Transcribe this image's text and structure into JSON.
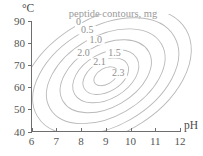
{
  "chart_data": {
    "type": "contour",
    "title": "peptide contours, mg",
    "xlabel": "pH",
    "ylabel": "°C",
    "xlim": [
      6,
      12
    ],
    "ylim": [
      40,
      90
    ],
    "xticks": [
      6,
      7,
      8,
      9,
      10,
      11,
      12
    ],
    "xtick_labels": [
      "6",
      "7",
      "8",
      "9",
      "10",
      "11",
      "12"
    ],
    "yticks": [
      40,
      50,
      60,
      70,
      80,
      90
    ],
    "ytick_labels": [
      "40",
      "50",
      "60",
      "70",
      "80",
      "90"
    ],
    "grid": false,
    "legend": "none",
    "units": "mg",
    "contour_levels": [
      0,
      0.5,
      1.0,
      1.5,
      2.0,
      2.1,
      2.3
    ],
    "contour_level_labels": [
      "0",
      "0.5",
      "1.0",
      "1.5",
      "2.0",
      "2.1",
      "2.3"
    ],
    "peak": {
      "pH": 9.0,
      "temperature_C": 65.0,
      "value_mg": 2.4
    },
    "contours": [
      {
        "level": 0,
        "label": "0",
        "label_position": {
          "pH": 7.9,
          "temperature_C": 88.6
        },
        "ellipse": {
          "cx_pH": 9.0,
          "cy_C": 65.0,
          "rx_pH": 3.75,
          "ry_C": 26.5,
          "rotation_deg": -30
        }
      },
      {
        "level": 0.5,
        "label": "0.5",
        "label_position": {
          "pH": 8.25,
          "temperature_C": 85.2
        },
        "ellipse": {
          "cx_pH": 9.0,
          "cy_C": 65.0,
          "rx_pH": 3.2,
          "ry_C": 22.5,
          "rotation_deg": -30
        }
      },
      {
        "level": 1.0,
        "label": "1.0",
        "label_position": {
          "pH": 8.6,
          "temperature_C": 80.6
        },
        "ellipse": {
          "cx_pH": 9.0,
          "cy_C": 65.0,
          "rx_pH": 2.6,
          "ry_C": 18.2,
          "rotation_deg": -30
        }
      },
      {
        "level": 1.5,
        "label": "1.5",
        "label_position": {
          "pH": 9.35,
          "temperature_C": 74.5
        },
        "ellipse": {
          "cx_pH": 9.0,
          "cy_C": 65.0,
          "rx_pH": 2.0,
          "ry_C": 14.0,
          "rotation_deg": -30
        }
      },
      {
        "level": 2.0,
        "label": "2.0",
        "label_position": {
          "pH": 8.1,
          "temperature_C": 74.4
        },
        "ellipse": {
          "cx_pH": 9.0,
          "cy_C": 65.0,
          "rx_pH": 1.45,
          "ry_C": 10.2,
          "rotation_deg": -30
        }
      },
      {
        "level": 2.1,
        "label": "2.1",
        "label_position": {
          "pH": 8.75,
          "temperature_C": 70.7
        },
        "ellipse": {
          "cx_pH": 9.0,
          "cy_C": 65.0,
          "rx_pH": 1.0,
          "ry_C": 7.0,
          "rotation_deg": -30
        }
      },
      {
        "level": 2.3,
        "label": "2.3",
        "label_position": {
          "pH": 9.5,
          "temperature_C": 65.4
        },
        "ellipse": {
          "cx_pH": 9.0,
          "cy_C": 65.0,
          "rx_pH": 0.52,
          "ry_C": 3.6,
          "rotation_deg": -30
        }
      }
    ],
    "colors": {
      "contour_line": "#b9b9b9",
      "axis": "#6e6e6e",
      "tick_text": "#555555",
      "title_text": "#9a9a9a",
      "background": "#ffffff"
    }
  }
}
